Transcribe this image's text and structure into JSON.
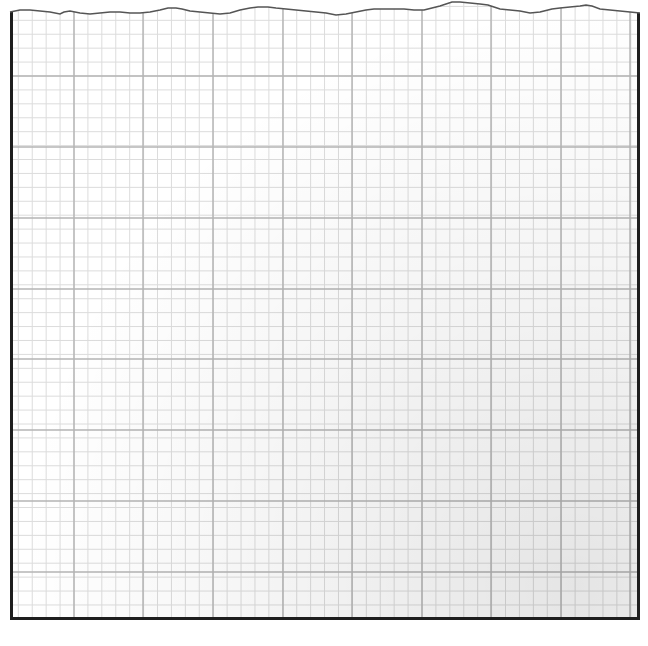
{
  "sheet": {
    "type": "graph-paper",
    "major_spacing_px": 69.6,
    "minor_per_major": 5,
    "colors": {
      "paper": "#ffffff",
      "border": "#1e1e1e",
      "major_line": "#b4b4b4",
      "minor_line": "#dcdcdc",
      "torn_edge": "#555555"
    },
    "major_vertical_x": [
      74,
      143,
      213,
      283,
      352,
      422,
      491,
      561,
      630
    ],
    "major_horizontal_y": [
      76,
      147,
      218,
      289,
      359,
      430,
      501,
      572
    ],
    "top_edge": "torn"
  }
}
